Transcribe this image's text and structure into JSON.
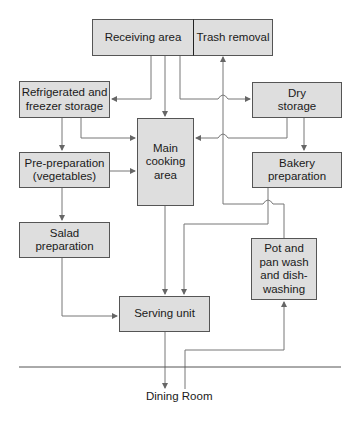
{
  "diagram": {
    "title": "",
    "nodes": [
      {
        "id": "receiving",
        "label": "Receiving area"
      },
      {
        "id": "trash",
        "label": "Trash removal"
      },
      {
        "id": "refrigerated",
        "label": "Refrigerated and\nfreezer storage"
      },
      {
        "id": "dry",
        "label": "Dry\nstorage"
      },
      {
        "id": "main",
        "label": "Main\ncooking\narea"
      },
      {
        "id": "preprep",
        "label": "Pre-preparation\n(vegetables)"
      },
      {
        "id": "bakery",
        "label": "Bakery\npreparation"
      },
      {
        "id": "salad",
        "label": "Salad\npreparation"
      },
      {
        "id": "potpan",
        "label": "Pot and\npan wash\nand dish-\nwashing"
      },
      {
        "id": "serving",
        "label": "Serving unit"
      }
    ],
    "edges": [
      {
        "from": "receiving",
        "to": "refrigerated"
      },
      {
        "from": "receiving",
        "to": "main"
      },
      {
        "from": "receiving",
        "to": "dry"
      },
      {
        "from": "refrigerated",
        "to": "preprep"
      },
      {
        "from": "refrigerated",
        "to": "main"
      },
      {
        "from": "dry",
        "to": "main"
      },
      {
        "from": "dry",
        "to": "bakery"
      },
      {
        "from": "preprep",
        "to": "main"
      },
      {
        "from": "preprep",
        "to": "salad"
      },
      {
        "from": "salad",
        "to": "serving"
      },
      {
        "from": "main",
        "to": "serving"
      },
      {
        "from": "bakery",
        "to": "serving"
      },
      {
        "from": "potpan",
        "to": "trash"
      },
      {
        "from": "serving",
        "to": "dining"
      },
      {
        "from": "dining",
        "to": "potpan"
      }
    ],
    "dining_label": "Dining Room"
  }
}
